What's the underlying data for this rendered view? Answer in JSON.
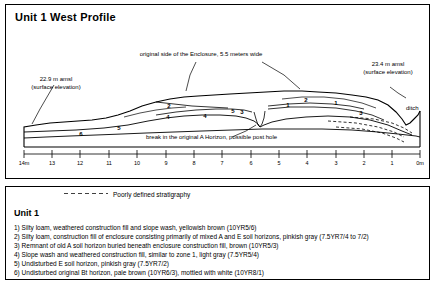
{
  "title": "Unit 1  West Profile",
  "annotations": {
    "left_elev": "22.9 m amsl\n(surface elevation)",
    "right_elev": "23.4 m amsl\n(surface elevation)",
    "enclosure": "original side of the Enclosure, 5.5 meters wide",
    "break": "break in the original A Horizon, possible post hole",
    "ditch": "ditch"
  },
  "axis": {
    "labels": [
      "14m",
      "13",
      "12",
      "11",
      "10",
      "9",
      "8",
      "7",
      "6",
      "5",
      "4",
      "3",
      "2",
      "1",
      "0m"
    ]
  },
  "zone_markers": [
    {
      "label": "1",
      "x": 330,
      "y": 99
    },
    {
      "label": "1",
      "x": 282,
      "y": 101
    },
    {
      "label": "2",
      "x": 300,
      "y": 96
    },
    {
      "label": "2",
      "x": 163,
      "y": 102
    },
    {
      "label": "3",
      "x": 355,
      "y": 109
    },
    {
      "label": "3",
      "x": 236,
      "y": 108
    },
    {
      "label": "4",
      "x": 199,
      "y": 112
    },
    {
      "label": "4",
      "x": 162,
      "y": 113
    },
    {
      "label": "5",
      "x": 227,
      "y": 107
    },
    {
      "label": "5",
      "x": 113,
      "y": 124
    },
    {
      "label": "6",
      "x": 75,
      "y": 130
    }
  ],
  "legend": {
    "dashed_key": "Poorly defined stratigraphy",
    "unit_label": "Unit 1",
    "items": [
      "1) Silty loam, weathered construction fill and slope wash, yellowish brown (10YR5/6)",
      "2) Silty loam, construction fill of enclosure consisting primarily of mixed A and E soil horizons, pinkish gray (7.5YR7/4 to 7/2)",
      "3) Remnant of old A soil horizon buried beneath enclosure construction fill, brown (10YR5/3)",
      "4) Slope wash and weathered construction fill, similar to zone 1, light gray (7.5YR5/4)",
      "5) Undisturbed E soil horizon, pinkish gray (7.5YR7/2)",
      "6) Undisturbed original Bt horizon, pale brown (10YR6/3), mottled with white (10YR8/1)"
    ]
  },
  "colors": {
    "ink": "#000000",
    "paper": "#ffffff"
  }
}
